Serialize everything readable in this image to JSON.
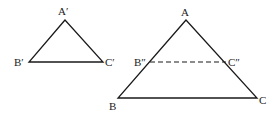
{
  "diagram": {
    "small_triangle": {
      "vertices": {
        "A": "A′",
        "B": "B′",
        "C": "C′"
      },
      "points": {
        "A": [
          65,
          20
        ],
        "B": [
          29,
          62
        ],
        "C": [
          103,
          62
        ]
      }
    },
    "large_triangle": {
      "vertices": {
        "A": "A",
        "B": "B",
        "C": "C"
      },
      "points": {
        "A": [
          186,
          20
        ],
        "B": [
          118,
          98
        ],
        "C": [
          257,
          98
        ]
      },
      "inner_points": {
        "B2": "B″",
        "C2": "C″"
      },
      "inner_coords": {
        "B2": [
          150,
          62
        ],
        "C2": [
          226,
          62
        ]
      },
      "inner_line_style": "dashed"
    },
    "stroke_color": "#1a1a1a"
  }
}
